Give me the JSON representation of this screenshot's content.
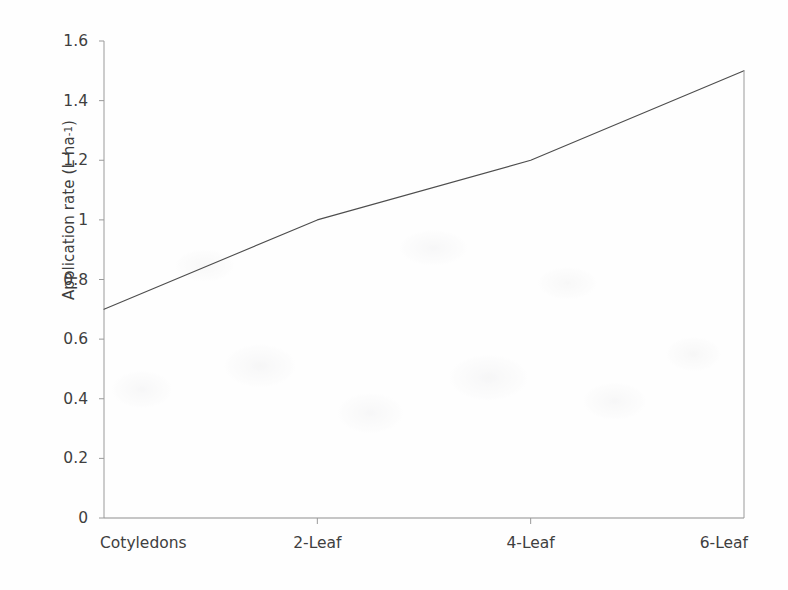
{
  "chart_data": {
    "type": "line",
    "title": "",
    "xlabel": "",
    "ylabel": "Application rate (L ha-1)",
    "ylabel_main": "Application rate (L ha",
    "ylabel_sup": "-1",
    "ylabel_tail": ")",
    "categories": [
      "Cotyledons",
      "2-Leaf",
      "4-Leaf",
      "6-Leaf"
    ],
    "values": [
      0.7,
      1.0,
      1.2,
      1.5
    ],
    "series": [
      {
        "name": "Application rate",
        "values": [
          0.7,
          1.0,
          1.2,
          1.5
        ]
      }
    ],
    "ylim": [
      0,
      1.6
    ],
    "yticks": [
      0,
      0.2,
      0.4,
      0.6,
      0.8,
      1,
      1.2,
      1.4,
      1.6
    ],
    "ytick_labels": [
      "0",
      "0.2",
      "0.4",
      "0.6",
      "0.8",
      "1",
      "1.2",
      "1.4",
      "1.6"
    ],
    "xtick_labels": [
      "Cotyledons",
      "2-Leaf",
      "4-Leaf",
      "6-Leaf"
    ],
    "grid": false,
    "legend": false,
    "legend_position": "none",
    "line_color": "#4d4d4d",
    "axis_color": "#9a9a9a",
    "background_color": "#ffffff",
    "markers": false
  },
  "figure": {
    "background_color": "#ffffff"
  }
}
